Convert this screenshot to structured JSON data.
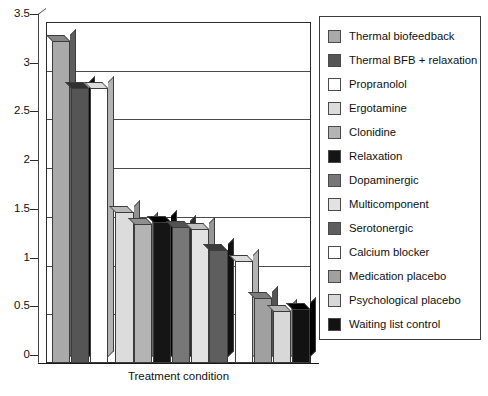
{
  "chart_data": {
    "type": "bar",
    "title": "",
    "xlabel": "Treatment condition",
    "ylabel": "",
    "ylim": [
      0,
      3.5
    ],
    "ytick_labels": [
      "0",
      "0.5",
      "1",
      "1.5",
      "2",
      "2.5",
      "3",
      "3.5"
    ],
    "ytick_values": [
      0,
      0.5,
      1,
      1.5,
      2,
      2.5,
      3,
      3.5
    ],
    "grid": "horizontal",
    "legend_position": "right",
    "categories": [
      "Thermal biofeedback",
      "Thermal BFB + relaxation",
      "Propranolol",
      "Ergotamine",
      "Clonidine",
      "Relaxation",
      "Dopaminergic",
      "Multicomponent",
      "Serotonergic",
      "Calcium blocker",
      "Medication placebo",
      "Psychological placebo",
      "Waiting list control"
    ],
    "values": [
      3.3,
      2.82,
      2.82,
      1.55,
      1.43,
      1.45,
      1.4,
      1.38,
      1.16,
      1.05,
      0.67,
      0.53,
      0.55
    ],
    "bar_colors": [
      "#a9a9a9",
      "#555555",
      "#ffffff",
      "#dcdcdc",
      "#b4b4b4",
      "#151515",
      "#777777",
      "#e2e2e2",
      "#5e5e5e",
      "#ffffff",
      "#a0a0a0",
      "#d8d8d8",
      "#121212"
    ]
  },
  "legend": {
    "items": [
      {
        "label": "Thermal biofeedback",
        "color": "#a9a9a9"
      },
      {
        "label": "Thermal BFB + relaxation",
        "color": "#555555"
      },
      {
        "label": "Propranolol",
        "color": "#ffffff"
      },
      {
        "label": "Ergotamine",
        "color": "#dcdcdc"
      },
      {
        "label": "Clonidine",
        "color": "#b4b4b4"
      },
      {
        "label": "Relaxation",
        "color": "#151515"
      },
      {
        "label": "Dopaminergic",
        "color": "#777777"
      },
      {
        "label": "Multicomponent",
        "color": "#e2e2e2"
      },
      {
        "label": "Serotonergic",
        "color": "#5e5e5e"
      },
      {
        "label": "Calcium blocker",
        "color": "#ffffff"
      },
      {
        "label": "Medication placebo",
        "color": "#a0a0a0"
      },
      {
        "label": "Psychological placebo",
        "color": "#d8d8d8"
      },
      {
        "label": "Waiting list control",
        "color": "#121212"
      }
    ]
  },
  "axis": {
    "x_title": "Treatment condition"
  }
}
